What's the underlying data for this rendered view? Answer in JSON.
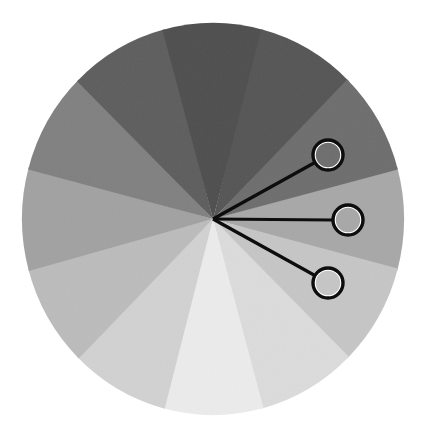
{
  "figure": {
    "name": "grayscale-sector-wheel",
    "background_color": "#ffffff",
    "canvas": {
      "width": 423,
      "height": 440
    },
    "center": {
      "x": 213,
      "y": 219
    },
    "radius": {
      "x": 191,
      "y": 196
    }
  },
  "chart_data": {
    "type": "pie",
    "title": "",
    "subtitle": "",
    "xlabel": "",
    "ylabel": "",
    "grid": false,
    "legend_position": "none",
    "annotations": [
      "callout marker on sector 2",
      "callout marker on sector 3",
      "callout marker on sector 4"
    ],
    "slice_count": 12,
    "equal_slices": true,
    "slice_angle_degrees": 30,
    "start_angle_degrees": -15,
    "direction": "clockwise",
    "categories": [
      "S1",
      "S2",
      "S3",
      "S4",
      "S5",
      "S6",
      "S7",
      "S8",
      "S9",
      "S10",
      "S11",
      "S12"
    ],
    "values": [
      30,
      30,
      30,
      30,
      30,
      30,
      30,
      30,
      30,
      30,
      30,
      30
    ],
    "slices": [
      {
        "label": "S1",
        "value": 30,
        "percent": 8.33,
        "start_deg": -15,
        "end_deg": 15,
        "color": "#a8a8a8",
        "gray_level": 168
      },
      {
        "label": "S2",
        "value": 30,
        "percent": 8.33,
        "start_deg": 15,
        "end_deg": 45,
        "color": "#c6c6c6",
        "gray_level": 198
      },
      {
        "label": "S3",
        "value": 30,
        "percent": 8.33,
        "start_deg": 45,
        "end_deg": 75,
        "color": "#dcdcdc",
        "gray_level": 220
      },
      {
        "label": "S4",
        "value": 30,
        "percent": 8.33,
        "start_deg": 75,
        "end_deg": 105,
        "color": "#ececec",
        "gray_level": 236
      },
      {
        "label": "S5",
        "value": 30,
        "percent": 8.33,
        "start_deg": 105,
        "end_deg": 135,
        "color": "#d2d2d2",
        "gray_level": 210
      },
      {
        "label": "S6",
        "value": 30,
        "percent": 8.33,
        "start_deg": 135,
        "end_deg": 165,
        "color": "#bcbcbc",
        "gray_level": 188
      },
      {
        "label": "S7",
        "value": 30,
        "percent": 8.33,
        "start_deg": 165,
        "end_deg": 195,
        "color": "#a2a2a2",
        "gray_level": 162
      },
      {
        "label": "S8",
        "value": 30,
        "percent": 8.33,
        "start_deg": 195,
        "end_deg": 225,
        "color": "#818181",
        "gray_level": 129
      },
      {
        "label": "S9",
        "value": 30,
        "percent": 8.33,
        "start_deg": 225,
        "end_deg": 255,
        "color": "#5e5e5e",
        "gray_level": 94
      },
      {
        "label": "S10",
        "value": 30,
        "percent": 8.33,
        "start_deg": 255,
        "end_deg": 285,
        "color": "#4f4f4f",
        "gray_level": 79
      },
      {
        "label": "S11",
        "value": 30,
        "percent": 8.33,
        "start_deg": 285,
        "end_deg": 315,
        "color": "#565656",
        "gray_level": 86
      },
      {
        "label": "S12",
        "value": 30,
        "percent": 8.33,
        "start_deg": 315,
        "end_deg": 345,
        "color": "#6e6e6e",
        "gray_level": 110
      }
    ]
  },
  "callouts": [
    {
      "id": "callout-top",
      "marker_center": {
        "x": 328,
        "y": 155
      },
      "marker_radius": 15,
      "fill_color": "#c9c9c9",
      "ring_color": "#0d0d0d",
      "line_from": {
        "x": 213,
        "y": 219
      },
      "line_to": {
        "x": 314,
        "y": 163
      }
    },
    {
      "id": "callout-middle",
      "marker_center": {
        "x": 348,
        "y": 220
      },
      "marker_radius": 15,
      "fill_color": "#dedede",
      "ring_color": "#0d0d0d",
      "line_from": {
        "x": 213,
        "y": 219
      },
      "line_to": {
        "x": 333,
        "y": 220
      }
    },
    {
      "id": "callout-bottom",
      "marker_center": {
        "x": 328,
        "y": 283
      },
      "marker_radius": 15,
      "fill_color": "#ededed",
      "ring_color": "#0d0d0d",
      "line_from": {
        "x": 213,
        "y": 219
      },
      "line_to": {
        "x": 314,
        "y": 275
      }
    }
  ]
}
